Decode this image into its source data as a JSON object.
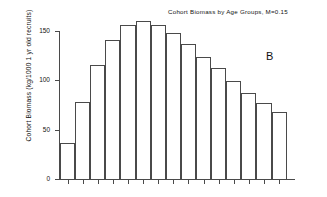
{
  "chart_data": {
    "type": "bar",
    "title": "Cohort Biomass by Age Groups, M=0.15",
    "xlabel": "",
    "ylabel": "Cohort Biomass (kg/1000 1 yr old recruits)",
    "panel_label": "B",
    "ylim": [
      0,
      162
    ],
    "yticks": [
      0,
      50,
      100,
      150
    ],
    "ytick_labels": [
      "0",
      "50",
      "100",
      "150"
    ],
    "grid": false,
    "legend": "none",
    "categories": [
      "1",
      "2",
      "3",
      "4",
      "5",
      "6",
      "7",
      "8",
      "9",
      "10",
      "11",
      "12",
      "13",
      "14",
      "15"
    ],
    "values": [
      36,
      78,
      116,
      141,
      156,
      160,
      156,
      148,
      137,
      124,
      112,
      99,
      87,
      77,
      68
    ],
    "xtick_count": 15
  },
  "colors": {
    "bar_outline": "#4a4a4a",
    "bar_fill": "transparent",
    "axis": "#4a4a4a",
    "text": "#111111",
    "background": "#ffffff"
  },
  "axes": {
    "y_top_px": 31,
    "y_zero_px": 179,
    "x_left_px": 59,
    "x_right_px": 295
  }
}
